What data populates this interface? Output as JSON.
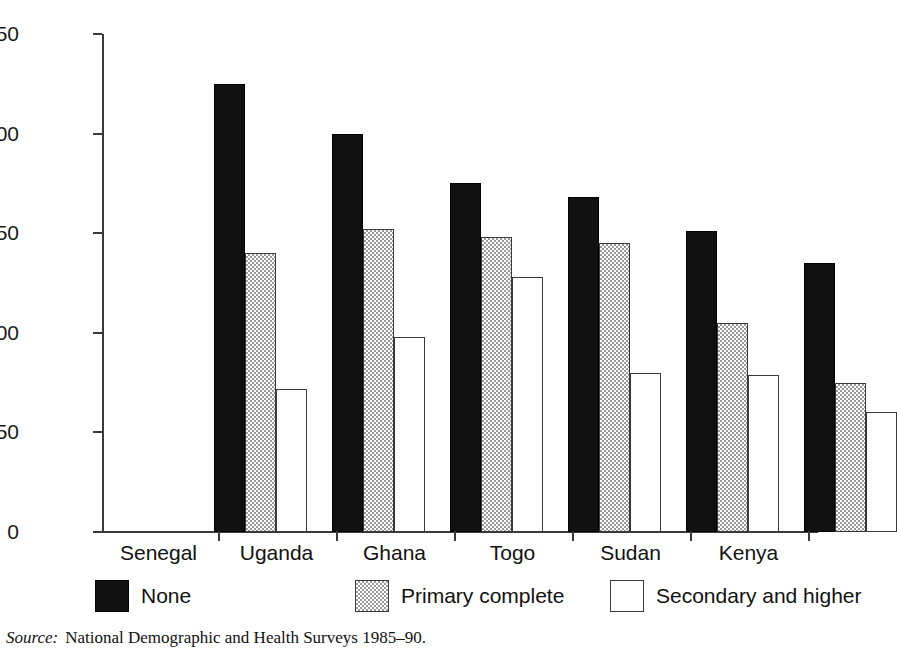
{
  "figure": {
    "title_fragment": "",
    "source_label": "Source:",
    "source_text": "National Demographic and Health Surveys 1985–90."
  },
  "chart_data": {
    "type": "bar",
    "title": "",
    "xlabel": "",
    "ylabel": "",
    "ylim": [
      0,
      250
    ],
    "yticks": [
      0,
      50,
      100,
      150,
      200,
      250
    ],
    "ytick_labels": [
      "0",
      "50",
      "100",
      "150",
      "200",
      "250"
    ],
    "grid": false,
    "legend_position": "bottom",
    "categories": [
      "Senegal",
      "Uganda",
      "Ghana",
      "Togo",
      "Sudan",
      "Kenya"
    ],
    "series": [
      {
        "name": "None",
        "color": "#111111",
        "values": [
          225,
          200,
          175,
          168,
          151,
          135
        ]
      },
      {
        "name": "Primary complete",
        "color": "#c8c8c8",
        "values": [
          140,
          152,
          148,
          145,
          105,
          75
        ]
      },
      {
        "name": "Secondary and higher",
        "color": "#ffffff",
        "values": [
          72,
          98,
          128,
          80,
          79,
          60
        ]
      }
    ]
  },
  "legend": {
    "entries": [
      {
        "label": "None",
        "swatch": "black-swatch"
      },
      {
        "label": "Primary complete",
        "swatch": "gray-hatch-swatch"
      },
      {
        "label": "Secondary and higher",
        "swatch": "white-swatch"
      }
    ]
  }
}
